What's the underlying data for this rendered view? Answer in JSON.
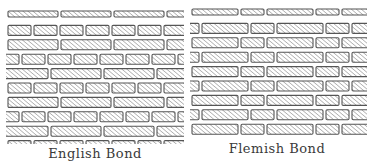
{
  "figure": {
    "panels": [
      {
        "id": "english",
        "caption": "English Bond",
        "x": 6,
        "y": 10,
        "width": 178,
        "height": 134,
        "pattern": "english",
        "caption_x": 95,
        "caption_y": 146
      },
      {
        "id": "flemish",
        "caption": "Flemish Bond",
        "x": 190,
        "y": 8,
        "width": 177,
        "height": 130,
        "pattern": "flemish",
        "caption_x": 277,
        "caption_y": 141
      }
    ],
    "brick": {
      "course_height": 14.4,
      "brick_height": 10,
      "stretcher_width": 50,
      "header_width": 23,
      "joint": 3
    },
    "colors": {
      "outline": "#555555",
      "hatch": "#8a8a8a",
      "fill": "#ffffff"
    }
  }
}
